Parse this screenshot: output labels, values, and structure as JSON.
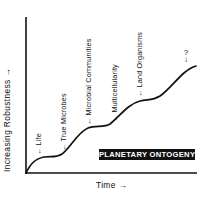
{
  "diagram": {
    "title": "PLANETARY ONTOGENY",
    "y_axis_label": "Increasing Robustness →",
    "x_axis_label": "Time →",
    "stages": [
      {
        "label": "← Life"
      },
      {
        "label": "← True Microbes"
      },
      {
        "label": "← Microbial Communities"
      },
      {
        "label": "← Multicellularity"
      },
      {
        "label": "← Land Organisms"
      }
    ],
    "future": {
      "label": "?",
      "arrow": "↓"
    },
    "colors": {
      "ink": "#111111",
      "background": "#ffffff"
    }
  }
}
